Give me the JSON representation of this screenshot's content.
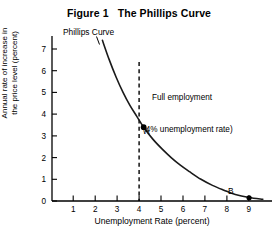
{
  "figure": {
    "title": "Figure 1   The Phillips Curve",
    "background_color": "#ffffff",
    "ink_color": "#000000"
  },
  "labels": {
    "curve_name": "Phillips Curve",
    "annotation_line1": "Full employment",
    "annotation_line2": "(4% unemployment rate)",
    "point_a": "A",
    "point_b": "B",
    "y_axis_line1": "Annual rate of increase in",
    "y_axis_line2": "the price level (percent)",
    "x_axis": "Unemployment Rate (percent)"
  },
  "chart_data": {
    "type": "line",
    "title": "Figure 1   The Phillips Curve",
    "xlabel": "Unemployment Rate (percent)",
    "ylabel": "Annual rate of increase in the price level (percent)",
    "xlim": [
      0,
      9.6
    ],
    "ylim": [
      0,
      7.6
    ],
    "xticks": [
      1,
      2,
      3,
      4,
      5,
      6,
      7,
      8,
      9
    ],
    "yticks": [
      0,
      1,
      2,
      3,
      4,
      5,
      6,
      7
    ],
    "xtick_labels": [
      "1",
      "2",
      "3",
      "4",
      "5",
      "6",
      "7",
      "8",
      "9"
    ],
    "ytick_labels": [
      "0",
      "1",
      "2",
      "3",
      "4",
      "5",
      "6",
      "7"
    ],
    "grid": false,
    "legend": null,
    "series": [
      {
        "name": "Phillips Curve",
        "label": "Phillips Curve",
        "color": "#1a1a1a",
        "x": [
          2.2,
          2.5,
          2.8,
          3.1,
          3.4,
          3.7,
          4.0,
          4.4,
          4.8,
          5.2,
          5.6,
          6.0,
          6.5,
          7.0,
          7.5,
          8.0,
          8.6,
          9.2
        ],
        "y": [
          7.4,
          6.5,
          5.7,
          5.0,
          4.4,
          3.9,
          3.4,
          2.85,
          2.4,
          2.0,
          1.65,
          1.35,
          1.0,
          0.72,
          0.5,
          0.3,
          0.16,
          0.08
        ]
      }
    ],
    "annotations": [
      {
        "name": "full-employment-line",
        "type": "vline",
        "x": 4.0,
        "y_from": 0,
        "y_to": 7.0,
        "style": "dashed",
        "text": "Full employment (4% unemployment rate)"
      },
      {
        "name": "point-a",
        "type": "point",
        "label": "A",
        "x": 4.0,
        "y": 3.4
      },
      {
        "name": "point-b",
        "type": "point",
        "label": "B",
        "x": 8.6,
        "y": 0.15
      }
    ]
  }
}
